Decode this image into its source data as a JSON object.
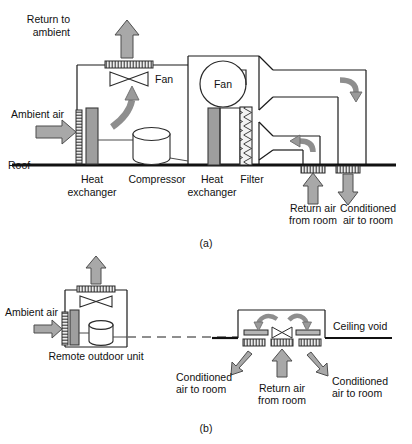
{
  "figure": {
    "type": "engineering-schematic",
    "panels": [
      {
        "id": "a",
        "caption": "(a)",
        "description": "Rooftop packaged air conditioning unit",
        "labels": {
          "return_to_ambient": "Return to\nambient",
          "return_to_ambient_line1": "Return to",
          "return_to_ambient_line2": "ambient",
          "fan_damper": "Fan",
          "fan_circle": "Fan",
          "ambient_air": "Ambient air",
          "roof": "Roof",
          "heat_exchanger_left_line1": "Heat",
          "heat_exchanger_left_line2": "exchanger",
          "compressor": "Compressor",
          "heat_exchanger_right_line1": "Heat",
          "heat_exchanger_right_line2": "exchanger",
          "filter": "Filter",
          "return_air_line1": "Return air",
          "return_air_line2": "from room",
          "conditioned_air_line1": "Conditioned",
          "conditioned_air_line2": "air to room"
        }
      },
      {
        "id": "b",
        "caption": "(b)",
        "description": "Split system with remote outdoor unit and ceiling void indoor unit",
        "labels": {
          "ambient_air": "Ambient air",
          "remote_outdoor_unit": "Remote outdoor unit",
          "ceiling_void": "Ceiling void",
          "conditioned_left_line1": "Conditioned",
          "conditioned_left_line2": "air to room",
          "return_air_line1": "Return air",
          "return_air_line2": "from room",
          "conditioned_right_line1": "Conditioned",
          "conditioned_right_line2": "air to room"
        }
      }
    ],
    "colors": {
      "line": "#1a1a1a",
      "arrow_fill": "#a8a8a8",
      "arrow_stroke": "#4d4d4d",
      "component_fill": "#9e9e9e",
      "component_stroke": "#3a3a3a",
      "grille_fill": "#e8e8e8",
      "background": "#ffffff"
    }
  }
}
